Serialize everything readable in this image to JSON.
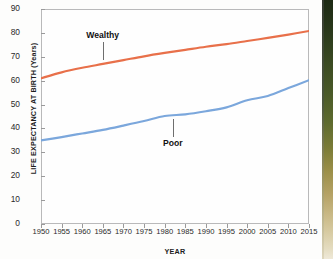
{
  "chart_data": {
    "type": "line",
    "title": "",
    "xlabel": "YEAR",
    "ylabel": "LIFE EXPECTANCY AT BIRTH (Years)",
    "xlim": [
      1950,
      2015
    ],
    "ylim": [
      0,
      90
    ],
    "xticks": [
      1950,
      1955,
      1960,
      1965,
      1970,
      1975,
      1980,
      1985,
      1990,
      1995,
      2000,
      2005,
      2010,
      2015
    ],
    "yticks": [
      0,
      10,
      20,
      30,
      40,
      50,
      60,
      70,
      80,
      90
    ],
    "grid": false,
    "legend_position": "inline-annotations",
    "x": [
      1950,
      1955,
      1960,
      1965,
      1970,
      1975,
      1980,
      1985,
      1990,
      1995,
      2000,
      2005,
      2010,
      2015
    ],
    "series": [
      {
        "name": "Wealthy",
        "color": "#e8704a",
        "values": [
          61.0,
          63.5,
          65.4,
          67.0,
          68.6,
          70.2,
          71.6,
          72.9,
          74.2,
          75.3,
          76.6,
          77.9,
          79.3,
          80.8
        ]
      },
      {
        "name": "Poor",
        "color": "#7ba7dc",
        "values": [
          35.0,
          36.4,
          37.9,
          39.4,
          41.2,
          43.1,
          45.2,
          45.9,
          47.2,
          48.8,
          51.8,
          53.6,
          56.9,
          60.2
        ]
      }
    ],
    "annotations": [
      {
        "label": "Wealthy",
        "series": "Wealthy",
        "x": 1965,
        "leader": "down"
      },
      {
        "label": "Poor",
        "series": "Poor",
        "x": 1982,
        "leader": "up"
      }
    ],
    "colors": {
      "wealthy_line": "#e8704a",
      "poor_line": "#7ba7dc",
      "axis": "#b9b9ba",
      "tick_text": "#2a2a2a",
      "label_text": "#1c1c1c",
      "leader": "#6e6e6e",
      "plot_background": "#fefefe",
      "page_background": "#fdfdfc"
    }
  },
  "artifact": {
    "name": "page-edge-strip",
    "top_color": "#1d2a14",
    "bottom_color": "#efe9d8"
  }
}
